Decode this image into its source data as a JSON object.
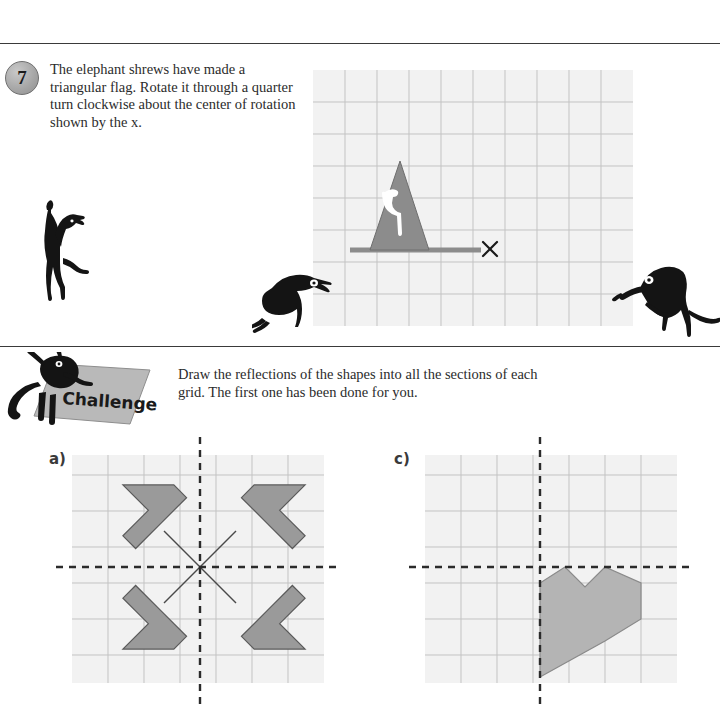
{
  "page": {
    "width": 720,
    "height": 719,
    "background": "#ffffff",
    "rules": [
      {
        "name": "top-rule",
        "y": 43
      },
      {
        "name": "middle-rule",
        "y": 346
      }
    ]
  },
  "question": {
    "number": "7",
    "text": "The elephant shrews have made a triangular flag. Rotate it through a quarter turn clockwise about the center of rotation shown by the x."
  },
  "challenge": {
    "banner_label": "Challenge",
    "text": "Draw the reflections of the shapes into all the sections of each grid. The first one has been done for you."
  },
  "labels": {
    "part_a": "a)",
    "part_c": "c)"
  },
  "colors": {
    "grid_background": "#f2f2f2",
    "grid_line": "#b9b9b9",
    "grid_line_major": "#8a8a8a",
    "shape_fill": "#9a9a9a",
    "shape_fill_light": "#b4b4b4",
    "shape_stroke": "#6a6a6a",
    "mirror_line": "#2b2b2b",
    "marker": "#1a1a1a",
    "rule": "#3a3a3a",
    "flag_fill": "#8c8c8c",
    "pole_fill": "#8c8c8c",
    "shrew_body": "#1a1a1a"
  },
  "rotation_grid": {
    "name": "rotation-grid",
    "x": 313,
    "y": 70,
    "width": 320,
    "height": 256,
    "cell": 32,
    "cols": 10,
    "rows": 8,
    "flag": {
      "name": "triangular-flag",
      "description": "gray triangle flag with white elephant shrew emblem",
      "apex": [
        400,
        161
      ],
      "base_left": [
        370,
        250
      ],
      "base_right": [
        429,
        250
      ],
      "fill": "#8c8c8c"
    },
    "pole": {
      "name": "flag-pole",
      "x1": 350,
      "y1": 250,
      "x2": 481,
      "y2": 250,
      "thickness": 5
    },
    "center_of_rotation": {
      "name": "center-of-rotation-marker",
      "symbol": "x",
      "x": 490,
      "y": 249,
      "size": 15
    }
  },
  "grid_a": {
    "name": "reflection-grid-a",
    "x": 72,
    "y": 455,
    "width": 252,
    "height": 228,
    "cell": 36,
    "cols": 7,
    "rows": 6.333,
    "mirror_vertical_x": 200,
    "mirror_horizontal_y": 567,
    "shapes_done": 4,
    "shape_description": "four gray arrow shapes forming a pinwheel, one in each quadrant, all reflections completed",
    "diagonal_lines": 4
  },
  "grid_c": {
    "name": "reflection-grid-c",
    "x": 425,
    "y": 455,
    "width": 252,
    "height": 228,
    "cell": 36,
    "cols": 7,
    "rows": 6.333,
    "mirror_vertical_x": 540,
    "mirror_horizontal_y": 567,
    "shapes_done": 1,
    "shape_description": "single gray heart-like shape in the bottom-right section awaiting reflection"
  }
}
